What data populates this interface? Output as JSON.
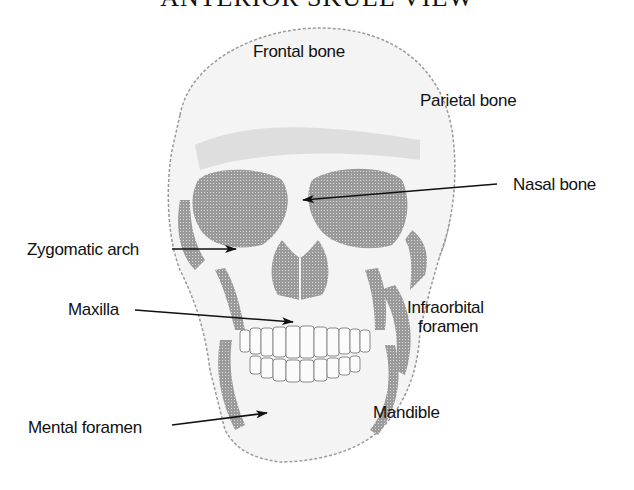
{
  "diagram": {
    "title": "ANTERIOR SKULL VIEW",
    "labels": {
      "frontal_bone": "Frontal bone",
      "parietal_bone": "Parietal bone",
      "nasal_bone": "Nasal bone",
      "zygomatic_arch": "Zygomatic arch",
      "maxilla": "Maxilla",
      "infraorbital_foramen_line1": "Infraorbital",
      "infraorbital_foramen_line2": "foramen",
      "mental_foramen": "Mental foramen",
      "mandible": "Mandible"
    },
    "colors": {
      "background": "#ffffff",
      "bone_shade": "#8c8c8c",
      "bone_light": "#f4f4f4",
      "ink": "#111111"
    }
  }
}
